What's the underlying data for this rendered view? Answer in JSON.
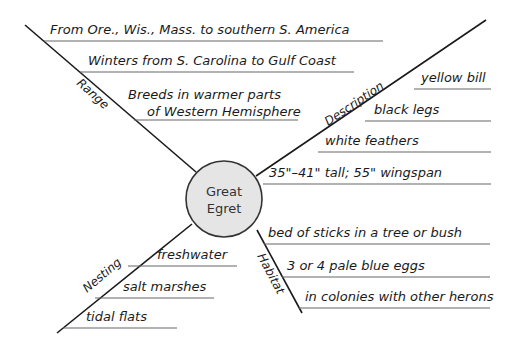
{
  "title": "Great Egret",
  "center": {
    "line1": "Great",
    "line2": "Egret",
    "fill": "#e5e5e5",
    "stroke": "#333333"
  },
  "branches": {
    "range": {
      "label": "Range",
      "items": [
        "From Ore., Wis., Mass. to southern S. America",
        "Winters from S. Carolina to Gulf Coast",
        "Breeds in warmer parts",
        "of Western Hemisphere"
      ]
    },
    "description": {
      "label": "Description",
      "items": [
        "yellow bill",
        "black legs",
        "white feathers",
        "35\"–41\" tall; 55\" wingspan"
      ]
    },
    "nesting": {
      "label": "Nesting",
      "items": [
        "freshwater",
        "salt marshes",
        "tidal flats"
      ]
    },
    "habitat": {
      "label": "Habitat",
      "items": [
        "bed of sticks in a tree or bush",
        "3 or 4 pale blue eggs",
        "in colonies with other herons"
      ]
    }
  }
}
